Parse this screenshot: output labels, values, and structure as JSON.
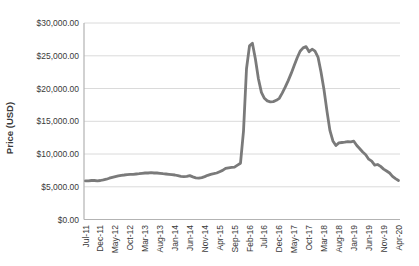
{
  "chart_data": {
    "type": "line",
    "title": "",
    "xlabel": "",
    "ylabel": "Price (USD)",
    "ylim": [
      0,
      30000
    ],
    "grid": "horizontal",
    "legend": "none",
    "x_tick_every": 5,
    "y_ticks": [
      {
        "value": 0,
        "label": "$0.00"
      },
      {
        "value": 5000,
        "label": "$5,000.00"
      },
      {
        "value": 10000,
        "label": "$10,000.00"
      },
      {
        "value": 15000,
        "label": "$15,000.00"
      },
      {
        "value": 20000,
        "label": "$20,000.00"
      },
      {
        "value": 25000,
        "label": "$25,000.00"
      },
      {
        "value": 30000,
        "label": "$30,000.00"
      }
    ],
    "colors": {
      "line": "#7a7a7a",
      "grid": "#dadada",
      "axis": "#b3b3b3",
      "text": "#3a3a3a"
    },
    "categories": [
      "Jul-11",
      "Aug-11",
      "Sep-11",
      "Oct-11",
      "Nov-11",
      "Dec-11",
      "Jan-12",
      "Feb-12",
      "Mar-12",
      "Apr-12",
      "May-12",
      "Jun-12",
      "Jul-12",
      "Aug-12",
      "Sep-12",
      "Oct-12",
      "Nov-12",
      "Dec-12",
      "Jan-13",
      "Feb-13",
      "Mar-13",
      "Apr-13",
      "May-13",
      "Jun-13",
      "Jul-13",
      "Aug-13",
      "Sep-13",
      "Oct-13",
      "Nov-13",
      "Dec-13",
      "Jan-14",
      "Feb-14",
      "Mar-14",
      "Apr-14",
      "May-14",
      "Jun-14",
      "Jul-14",
      "Aug-14",
      "Sep-14",
      "Oct-14",
      "Nov-14",
      "Dec-14",
      "Jan-15",
      "Feb-15",
      "Mar-15",
      "Apr-15",
      "May-15",
      "Jun-15",
      "Jul-15",
      "Aug-15",
      "Sep-15",
      "Oct-15",
      "Nov-15",
      "Dec-15",
      "Jan-16",
      "Feb-16",
      "Mar-16",
      "Apr-16",
      "May-16",
      "Jun-16",
      "Jul-16",
      "Aug-16",
      "Sep-16",
      "Oct-16",
      "Nov-16",
      "Dec-16",
      "Jan-17",
      "Feb-17",
      "Mar-17",
      "Apr-17",
      "May-17",
      "Jun-17",
      "Jul-17",
      "Aug-17",
      "Sep-17",
      "Oct-17",
      "Nov-17",
      "Dec-17",
      "Jan-18",
      "Feb-18",
      "Mar-18",
      "Apr-18",
      "May-18",
      "Jun-18",
      "Jul-18",
      "Aug-18",
      "Sep-18",
      "Oct-18",
      "Nov-18",
      "Dec-18",
      "Jan-19",
      "Feb-19",
      "Mar-19",
      "Apr-19",
      "May-19",
      "Jun-19",
      "Jul-19",
      "Aug-19",
      "Sep-19",
      "Oct-19",
      "Nov-19",
      "Dec-19",
      "Jan-20",
      "Feb-20",
      "Mar-20",
      "Apr-20"
    ],
    "series": [
      {
        "name": "Price",
        "values": [
          5900,
          5900,
          5950,
          5950,
          5900,
          5950,
          6050,
          6150,
          6300,
          6450,
          6550,
          6650,
          6750,
          6800,
          6850,
          6900,
          6900,
          6950,
          7000,
          7050,
          7100,
          7100,
          7150,
          7100,
          7100,
          7050,
          7000,
          6950,
          6900,
          6850,
          6800,
          6700,
          6600,
          6550,
          6600,
          6700,
          6500,
          6350,
          6300,
          6400,
          6550,
          6750,
          6900,
          7000,
          7100,
          7300,
          7500,
          7800,
          7900,
          7950,
          8000,
          8300,
          8600,
          13500,
          23000,
          26500,
          26900,
          24500,
          21500,
          19400,
          18500,
          18100,
          17950,
          18000,
          18200,
          18500,
          19300,
          20200,
          21200,
          22300,
          23500,
          24700,
          25700,
          26200,
          26400,
          25600,
          26000,
          25700,
          24800,
          22500,
          19800,
          16500,
          13600,
          12000,
          11300,
          11700,
          11750,
          11800,
          11900,
          11850,
          11950,
          11300,
          10800,
          10300,
          9900,
          9200,
          8900,
          8300,
          8400,
          8100,
          7700,
          7400,
          7100,
          6600,
          6250,
          5950
        ]
      }
    ]
  }
}
